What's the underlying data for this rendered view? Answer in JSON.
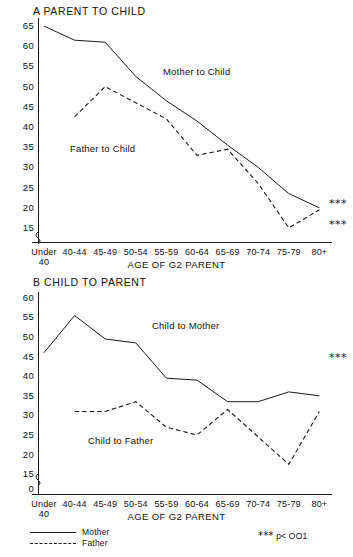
{
  "figure": {
    "axis_title": "AGE OF G2 PARENT",
    "significance_note": "p< OO1",
    "significance_marker": "★★★",
    "stars_text": "***"
  },
  "legend": {
    "position": "bottom-left",
    "items": [
      {
        "label": "Mother",
        "style": "solid"
      },
      {
        "label": "Father",
        "style": "dashed"
      }
    ]
  },
  "chart_data": [
    {
      "type": "line",
      "panel": "A",
      "title": "A  PARENT TO CHILD",
      "xlabel": "AGE OF G2 PARENT",
      "ylabel": "",
      "ylim": [
        15,
        65
      ],
      "yticks": [
        65,
        60,
        55,
        50,
        45,
        40,
        35,
        30,
        25,
        20,
        15
      ],
      "axis_break": true,
      "grid": false,
      "categories": [
        "Under 40",
        "40-44",
        "45-49",
        "50-54",
        "55-59",
        "60-64",
        "65-69",
        "70-74",
        "75-79",
        "80+"
      ],
      "series": [
        {
          "name": "Mother",
          "inline_label": "Mother to Child",
          "style": "solid",
          "values": [
            65.0,
            61.5,
            61.0,
            52.5,
            46.5,
            41.5,
            35.5,
            30.0,
            23.5,
            20.0
          ],
          "end_marker": "***"
        },
        {
          "name": "Father",
          "inline_label": "Father to Child",
          "style": "dashed",
          "values": [
            null,
            42.5,
            50.0,
            46.0,
            42.0,
            33.0,
            34.5,
            26.0,
            15.0,
            19.5
          ],
          "end_marker": "***"
        }
      ]
    },
    {
      "type": "line",
      "panel": "B",
      "title": "B  CHILD TO PARENT",
      "xlabel": "AGE OF G2 PARENT",
      "ylabel": "",
      "ylim": [
        0,
        60
      ],
      "yticks": [
        60,
        55,
        50,
        45,
        40,
        35,
        30,
        25,
        20,
        15,
        0
      ],
      "axis_break": true,
      "grid": false,
      "categories": [
        "Under 40",
        "40-44",
        "45-49",
        "50-54",
        "55-59",
        "60-64",
        "65-69",
        "70-74",
        "75-79",
        "80+"
      ],
      "series": [
        {
          "name": "Mother",
          "inline_label": "Child to Mother",
          "style": "solid",
          "values": [
            46.0,
            55.5,
            49.5,
            48.5,
            39.5,
            39.0,
            33.5,
            33.5,
            36.0,
            35.0
          ],
          "end_marker": "***"
        },
        {
          "name": "Father",
          "inline_label": "Child to Father",
          "style": "dashed",
          "values": [
            null,
            31.0,
            31.0,
            33.5,
            27.0,
            25.0,
            31.5,
            24.5,
            17.5,
            31.0
          ],
          "end_marker": null
        }
      ]
    }
  ]
}
